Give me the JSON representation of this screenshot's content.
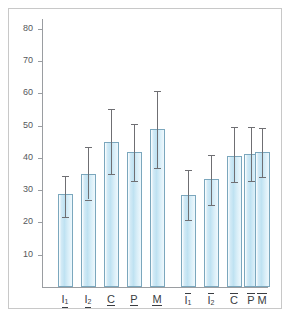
{
  "figure": {
    "background_color": "#ffffff",
    "frame_color": "#c8c8c8",
    "bar_fill_color": "#bfe2f2",
    "bar_edge_color": "#7ba7bd",
    "error_bar_color": "#6f6f73",
    "axis_color": "#9a9da1"
  },
  "chart_data": {
    "type": "bar",
    "title": "",
    "subtitle": "",
    "xlabel": "",
    "ylabel": "",
    "ylim": [
      0,
      83
    ],
    "xlim": [
      0,
      11
    ],
    "grid": false,
    "legend": null,
    "legend_position": "none",
    "error_bars": "symmetric",
    "categories": [
      "I1_under",
      "I2_under",
      "C_under",
      "P_under",
      "M_under",
      "I1_over",
      "I2_over",
      "C_over",
      "P_over",
      "M_over"
    ],
    "category_labels": [
      {
        "letter": "I",
        "sub": "1",
        "decoration": "underline"
      },
      {
        "letter": "I",
        "sub": "2",
        "decoration": "underline"
      },
      {
        "letter": "C",
        "sub": "",
        "decoration": "underline"
      },
      {
        "letter": "P",
        "sub": "",
        "decoration": "underline"
      },
      {
        "letter": "M",
        "sub": "",
        "decoration": "underline"
      },
      {
        "letter": "I",
        "sub": "1",
        "decoration": "overline"
      },
      {
        "letter": "I",
        "sub": "2",
        "decoration": "overline"
      },
      {
        "letter": "C",
        "sub": "",
        "decoration": "overline"
      },
      {
        "letter": "P",
        "sub": "",
        "decoration": "overline"
      },
      {
        "letter": "M",
        "sub": "",
        "decoration": "overline"
      }
    ],
    "values": [
      28.8,
      35.0,
      45.0,
      41.8,
      48.9,
      28.4,
      33.5,
      40.7,
      41.2,
      41.8
    ],
    "err_low": [
      21.8,
      27.1,
      35.0,
      32.7,
      36.9,
      20.7,
      25.5,
      32.4,
      32.8,
      34.2
    ],
    "err_high": [
      34.5,
      43.3,
      55.0,
      50.6,
      60.6,
      36.2,
      40.8,
      49.5,
      49.5,
      49.3
    ],
    "yticks": [
      10,
      20,
      30,
      40,
      50,
      60,
      70,
      80
    ],
    "ytick_labels": [
      "10",
      "20",
      "30",
      "40",
      "50",
      "60",
      "70",
      "80"
    ]
  },
  "geometry": {
    "plot_left": 42,
    "plot_right": 268,
    "baseline_y": 287,
    "y_top_value": 80,
    "y_top_px": 29,
    "px_per_unit": 3.2286,
    "bar_width": 15,
    "bar_centers": [
      65,
      88,
      111,
      134,
      157,
      188,
      211,
      234,
      251,
      262
    ],
    "group_gap": 14
  }
}
